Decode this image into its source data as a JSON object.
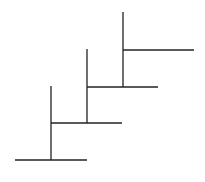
{
  "diagram": {
    "title": "",
    "background": "#ffffff",
    "stroke_color": "#222222",
    "stroke_width": 1.3,
    "steps": [
      {
        "horizontal": {
          "x1": 15,
          "y": 160,
          "x2": 87
        },
        "vertical": {
          "x": 51,
          "y1": 86,
          "y2": 160
        }
      },
      {
        "horizontal": {
          "x1": 51,
          "y": 123,
          "x2": 122
        },
        "vertical": {
          "x": 87,
          "y1": 49,
          "y2": 123
        }
      },
      {
        "horizontal": {
          "x1": 87,
          "y": 87,
          "x2": 158
        },
        "vertical": {
          "x": 123,
          "y1": 12,
          "y2": 87
        }
      },
      {
        "horizontal": {
          "x1": 123,
          "y": 50,
          "x2": 194
        },
        "vertical": null
      }
    ]
  }
}
